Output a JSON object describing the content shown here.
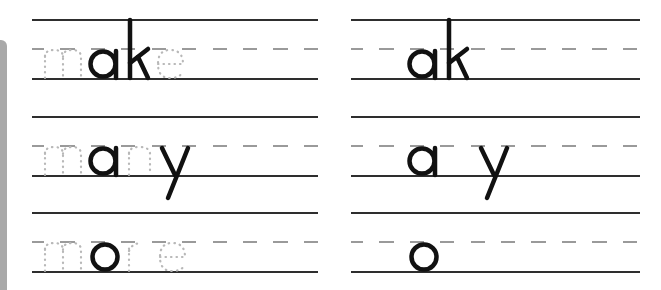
{
  "worksheet": {
    "type": "handwriting-practice",
    "left_column": {
      "rows": [
        {
          "word": "make",
          "traced_letters": [
            "m",
            "e"
          ],
          "solid_letters": [
            "a",
            "k"
          ]
        },
        {
          "word": "many",
          "traced_letters": [
            "m",
            "n"
          ],
          "solid_letters": [
            "a",
            "y"
          ]
        },
        {
          "word": "more",
          "traced_letters": [
            "m",
            "r",
            "e"
          ],
          "solid_letters": [
            "o"
          ]
        }
      ]
    },
    "right_column": {
      "rows": [
        {
          "pattern": "_ak_",
          "solid_letters": [
            "a",
            "k"
          ]
        },
        {
          "pattern": "_a_y",
          "solid_letters": [
            "a",
            "y"
          ]
        },
        {
          "pattern": "_o__",
          "solid_letters": [
            "o"
          ]
        }
      ]
    },
    "colors": {
      "ruled_line": "#2e2e2e",
      "dashed_midline": "#9a9a9a",
      "traced_letter": "#b8b8b8",
      "solid_letter": "#111111",
      "side_bar": "#a9a9a9"
    }
  }
}
